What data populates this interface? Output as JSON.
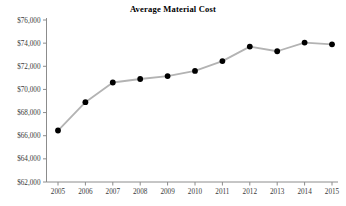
{
  "chart_data": {
    "type": "line",
    "title": "Average Material Cost",
    "xlabel": "",
    "ylabel": "",
    "categories": [
      "2005",
      "2006",
      "2007",
      "2008",
      "2009",
      "2010",
      "2011",
      "2012",
      "2013",
      "2014",
      "2015"
    ],
    "values": [
      66450,
      68900,
      70600,
      70900,
      71150,
      71600,
      72450,
      73700,
      73300,
      74050,
      73900
    ],
    "x": [
      2005,
      2006,
      2007,
      2008,
      2009,
      2010,
      2011,
      2012,
      2013,
      2014,
      2015
    ],
    "ylim": [
      62000,
      76000
    ],
    "ytick_step": 2000,
    "ytick_labels": [
      "$62,000",
      "$64,000",
      "$66,000",
      "$68,000",
      "$70,000",
      "$72,000",
      "$74,000",
      "$76,000"
    ],
    "ytick_values": [
      62000,
      64000,
      66000,
      68000,
      70000,
      72000,
      74000,
      76000
    ],
    "xtick_labels": [
      "2005",
      "2006",
      "2007",
      "2008",
      "2009",
      "2010",
      "2011",
      "2012",
      "2013",
      "2014",
      "2015"
    ],
    "grid": false,
    "legend": null,
    "legend_position": "none",
    "series": [
      {
        "name": "Average Material Cost",
        "values": [
          66450,
          68900,
          70600,
          70900,
          71150,
          71600,
          72450,
          73700,
          73300,
          74050,
          73900
        ],
        "line_color": "#b3b3b3",
        "marker_color": "#000000",
        "marker": "circle"
      }
    ]
  },
  "style": {
    "axis_color": "#8c8c8c",
    "tick_label_color": "#3a3a3a",
    "title_color": "#000000",
    "background": "#ffffff"
  }
}
